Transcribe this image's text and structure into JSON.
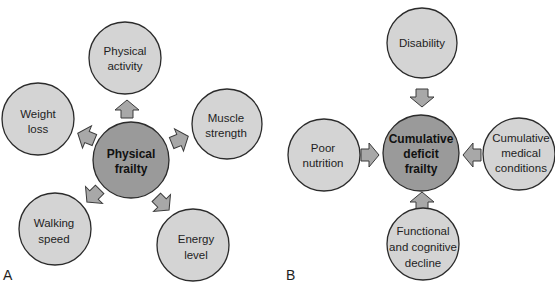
{
  "panels": [
    {
      "letter": "A",
      "center": {
        "lines": [
          "Physical",
          "frailty"
        ]
      },
      "arrow_direction": "outward",
      "nodes": [
        {
          "id": "physical-activity",
          "lines": [
            "Physical",
            "activity"
          ]
        },
        {
          "id": "weight-loss",
          "lines": [
            "Weight",
            "loss"
          ]
        },
        {
          "id": "muscle-strength",
          "lines": [
            "Muscle",
            "strength"
          ]
        },
        {
          "id": "walking-speed",
          "lines": [
            "Walking",
            "speed"
          ]
        },
        {
          "id": "energy-level",
          "lines": [
            "Energy",
            "level"
          ]
        }
      ]
    },
    {
      "letter": "B",
      "center": {
        "lines": [
          "Cumulative",
          "deficit",
          "frailty"
        ]
      },
      "arrow_direction": "inward",
      "nodes": [
        {
          "id": "disability",
          "lines": [
            "Disability"
          ]
        },
        {
          "id": "poor-nutrition",
          "lines": [
            "Poor",
            "nutrition"
          ]
        },
        {
          "id": "cumulative-medical-conditions",
          "lines": [
            "Cumulative",
            "medical",
            "conditions"
          ]
        },
        {
          "id": "functional-cognitive-decline",
          "lines": [
            "Functional",
            "and cognitive",
            "decline"
          ]
        }
      ]
    }
  ],
  "colors": {
    "outer_fill": "#d4d4d4",
    "center_fill": "#9a9a9a",
    "arrow_fill": "#a8a8a8",
    "stroke": "#2b2b2b"
  }
}
